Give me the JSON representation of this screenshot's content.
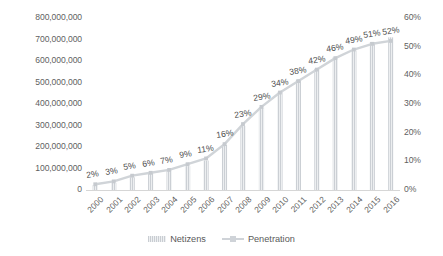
{
  "chart_data": {
    "type": "bar",
    "title": "",
    "subtitle": "",
    "xlabel": "",
    "ylabel": "",
    "grid": false,
    "legend_position": "bottom",
    "categories": [
      "2000",
      "2001",
      "2002",
      "2003",
      "2004",
      "2005",
      "2006",
      "2007",
      "2008",
      "2009",
      "2010",
      "2011",
      "2012",
      "2013",
      "2014",
      "2015",
      "2016"
    ],
    "series": [
      {
        "name": "Netizens",
        "type": "bar",
        "axis": "left",
        "color": "#d3d7db",
        "values": [
          22500000,
          33700000,
          59100000,
          79500000,
          94000000,
          111000000,
          137000000,
          210000000,
          298000000,
          384000000,
          457000000,
          513000000,
          564000000,
          618000000,
          649000000,
          688000000,
          710000000
        ]
      },
      {
        "name": "Penetration",
        "type": "line",
        "axis": "right",
        "color": "#d0d4d8",
        "values": [
          2,
          3,
          5,
          6,
          7,
          9,
          11,
          16,
          23,
          29,
          34,
          38,
          42,
          46,
          49,
          51,
          52
        ],
        "data_labels": [
          "2%",
          "3%",
          "5%",
          "6%",
          "7%",
          "9%",
          "11%",
          "16%",
          "23%",
          "29%",
          "34%",
          "38%",
          "42%",
          "46%",
          "49%",
          "51%",
          "52%"
        ]
      }
    ],
    "y_axis_left": {
      "min": 0,
      "max": 800000000,
      "step": 100000000,
      "tick_labels": [
        "0",
        "100,000,000",
        "200,000,000",
        "300,000,000",
        "400,000,000",
        "500,000,000",
        "600,000,000",
        "700,000,000",
        "800,000,000"
      ]
    },
    "y_axis_right": {
      "min": 0,
      "max": 60,
      "step": 10,
      "tick_labels": [
        "0%",
        "10%",
        "20%",
        "30%",
        "40%",
        "50%",
        "60%"
      ]
    }
  },
  "legend": {
    "items": [
      {
        "label": "Netizens",
        "marker": "bar-swatch"
      },
      {
        "label": "Penetration",
        "marker": "line-swatch"
      }
    ]
  },
  "colors": {
    "bar": "#d3d7db",
    "line": "#d0d4d8",
    "text": "#5a5a5a",
    "background": "#ffffff",
    "axis": "#d6d6d6"
  }
}
